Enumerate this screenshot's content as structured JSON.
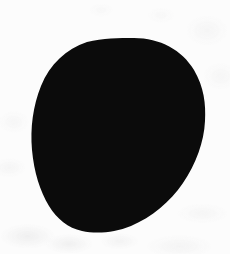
{
  "image": {
    "kind": "scanned-silhouette",
    "width": 230,
    "height": 254,
    "background_color": "#fcfcfc",
    "background_description": "off-white scanned paper with faint gray mottling",
    "alt_text": "Solid black rounded blob silhouette on off-white paper"
  },
  "shape": {
    "name": "blob-silhouette",
    "fill_color": "#0b0b0b",
    "description": "Egg or teardrop shaped solid black blob, broad and rounded across the top, tapering with a blunt rounded base toward the lower left, the lower right edge sweeping inward in a long concave curve",
    "bounds": {
      "left": 32,
      "top": 38,
      "right": 205,
      "bottom": 232
    },
    "extremes": {
      "topmost_x": 134,
      "topmost_y": 38,
      "leftmost_x": 32,
      "leftmost_y": 126,
      "rightmost_x": 205,
      "rightmost_y": 120,
      "bottommost_x": 86,
      "bottommost_y": 232
    },
    "outline_path": "M 134 38 C 160 38 182 50 194 70 C 204 87 206 104 205 121 C 204 142 196 164 183 183 C 170 202 152 217 131 226 C 114 233 96 234 82 231 C 68 228 57 219 49 206 C 40 191 34 172 32 150 C 30 128 33 106 41 86 C 50 64 66 49 87 42 C 103 38 119 38 134 38 Z"
  }
}
